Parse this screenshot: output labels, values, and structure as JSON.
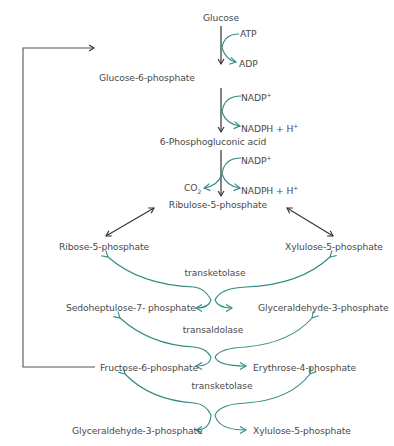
{
  "diagram": {
    "colors": {
      "text": "#4a4a4a",
      "main_arrow": "#333333",
      "cofactor_arrow": "#2e8b82",
      "feedback_line": "#555555"
    },
    "oxidative_phase": {
      "nodes": {
        "glucose": "Glucose",
        "g6p": "Glucose-6-phosphate",
        "pga": "6-Phosphogluconic acid",
        "ru5p": "Ribulose-5-phosphate"
      },
      "cofactors": {
        "atp": "ATP",
        "adp": "ADP",
        "nadp1": "NADP",
        "nadp1_sup": "+",
        "nadph1": "NADPH + H",
        "nadph1_sup": "+",
        "nadp2": "NADP",
        "nadp2_sup": "+",
        "co2": "CO",
        "co2_sub": "2",
        "nadph2": "NADPH + H",
        "nadph2_sup": "+"
      }
    },
    "non_oxidative_phase": {
      "step1": {
        "left_in": "Ribose-5-phosphate",
        "right_in": "Xylulose-5-phosphate",
        "enzyme": "transketolase",
        "left_out": "Sedoheptulose-7- phosphate",
        "right_out": "Glyceraldehyde-3-phosphate"
      },
      "step2": {
        "enzyme": "transaldolase",
        "left_out": "Fructose-6-phosphate",
        "right_out": "Erythrose-4-phosphate"
      },
      "step3": {
        "enzyme": "transketolase",
        "left_out": "Glyceraldehyde-3-phosphate",
        "right_out": "Xylulose-5-phosphate"
      }
    }
  }
}
